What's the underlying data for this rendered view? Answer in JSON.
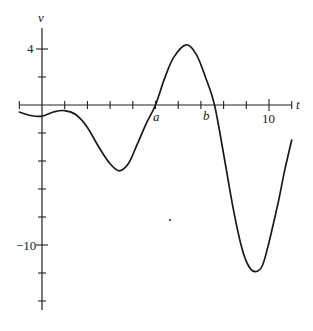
{
  "chart_data": {
    "type": "line",
    "title": "",
    "xlabel": "t",
    "ylabel": "v",
    "xlim": [
      -1,
      11
    ],
    "ylim": [
      -14,
      5
    ],
    "grid": false,
    "x_ticks": [
      -1,
      0,
      1,
      2,
      3,
      4,
      5,
      6,
      7,
      8,
      9,
      10,
      11
    ],
    "x_tick_labels": [
      {
        "t": 10,
        "label": "10"
      }
    ],
    "y_ticks": [
      4,
      2,
      0,
      -2,
      -4,
      -6,
      -8,
      -10,
      -12,
      -14
    ],
    "y_tick_labels": [
      {
        "v": 4,
        "label": "4"
      },
      {
        "v": -10,
        "label": "-10"
      }
    ],
    "annotations": [
      {
        "label": "a",
        "t": 5.0,
        "v": 0,
        "note": "zero crossing"
      },
      {
        "label": "b",
        "t": 7.6,
        "v": 0,
        "note": "zero crossing"
      }
    ],
    "series": [
      {
        "name": "v(t)",
        "x": [
          -1,
          -0.5,
          0,
          0.5,
          1,
          1.5,
          2,
          2.5,
          3,
          3.4,
          3.8,
          4.2,
          4.6,
          5.0,
          5.4,
          5.8,
          6.35,
          6.8,
          7.2,
          7.6,
          8.0,
          8.4,
          8.8,
          9.1,
          9.4,
          9.7,
          10.0,
          10.4,
          10.7,
          11.0
        ],
        "values": [
          -0.5,
          -0.75,
          -0.8,
          -0.5,
          -0.4,
          -0.7,
          -1.6,
          -3.0,
          -4.2,
          -4.7,
          -4.2,
          -2.8,
          -1.3,
          0.0,
          1.9,
          3.4,
          4.3,
          3.6,
          2.0,
          0.0,
          -3.5,
          -7.2,
          -10.2,
          -11.5,
          -11.9,
          -11.5,
          -9.8,
          -7.0,
          -4.6,
          -2.5
        ]
      }
    ]
  },
  "labels": {
    "y_axis": "v",
    "x_axis": "t",
    "y_tick_4": "4",
    "y_tick_neg10": "−10",
    "x_tick_10": "10",
    "point_a": "a",
    "point_b": "b"
  }
}
